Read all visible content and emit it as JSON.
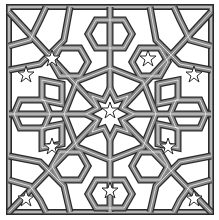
{
  "image": {
    "subject": "Islamic geometric interlace pattern",
    "symmetry": "8-fold",
    "colors": {
      "background": "#ffffff",
      "band_fill": "#8a8a8a",
      "band_outline": "#2a2a2a",
      "highlight": "#ffffff"
    }
  }
}
